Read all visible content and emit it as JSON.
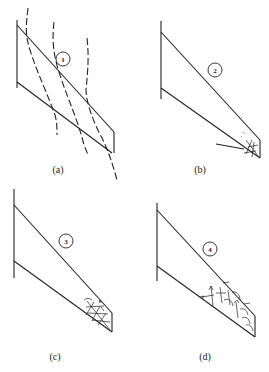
{
  "figure": {
    "panels": [
      {
        "id": "a",
        "label": "(a)",
        "stage": "1"
      },
      {
        "id": "b",
        "label": "(b)",
        "stage": "2"
      },
      {
        "id": "c",
        "label": "(c)",
        "stage": "3"
      },
      {
        "id": "d",
        "label": "(d)",
        "stage": "4"
      }
    ]
  }
}
